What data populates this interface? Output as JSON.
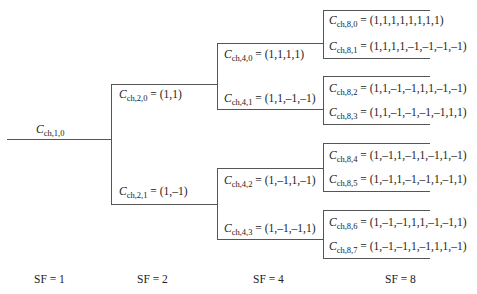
{
  "diagram": {
    "type": "ovsf-code-tree",
    "root": {
      "symbol": "C",
      "subscript": "ch,1,0",
      "value": ""
    },
    "sf2": [
      {
        "symbol": "C",
        "subscript": "ch,2,0",
        "value": " = (1,1)"
      },
      {
        "symbol": "C",
        "subscript": "ch,2,1",
        "value": " = (1,–1)"
      }
    ],
    "sf4": [
      {
        "symbol": "C",
        "subscript": "ch,4,0",
        "value": " = (1,1,1,1)"
      },
      {
        "symbol": "C",
        "subscript": "ch,4,1",
        "value": " = (1,1,–1,–1)"
      },
      {
        "symbol": "C",
        "subscript": "ch,4,2",
        "value": " = (1,–1,1,–1)"
      },
      {
        "symbol": "C",
        "subscript": "ch,4,3",
        "value": " = (1,–1,–1,1)"
      }
    ],
    "sf8": [
      {
        "symbol": "C",
        "subscript": "ch,8,0",
        "value": " = (1,1,1,1,1,1,1,1)"
      },
      {
        "symbol": "C",
        "subscript": "ch,8,1",
        "value": " = (1,1,1,1,–1,–1,–1,–1)"
      },
      {
        "symbol": "C",
        "subscript": "ch,8,2",
        "value": " = (1,1,–1,–1,1,1,–1,–1)"
      },
      {
        "symbol": "C",
        "subscript": "ch,8,3",
        "value": " = (1,1,–1,–1,–1,–1,1,1)"
      },
      {
        "symbol": "C",
        "subscript": "ch,8,4",
        "value": " = (1,–1,1,–1,1,–1,1,–1)"
      },
      {
        "symbol": "C",
        "subscript": "ch,8,5",
        "value": " = (1,–1,1,–1,–1,1,–1,1)"
      },
      {
        "symbol": "C",
        "subscript": "ch,8,6",
        "value": " = (1,–1,–1,1,1,–1,–1,1)"
      },
      {
        "symbol": "C",
        "subscript": "ch,8,7",
        "value": " = (1,–1,–1,1,–1,1,1,–1)"
      }
    ],
    "spreading_factors": [
      "SF = 1",
      "SF = 2",
      "SF = 4",
      "SF = 8"
    ],
    "line_color": "#555555"
  }
}
